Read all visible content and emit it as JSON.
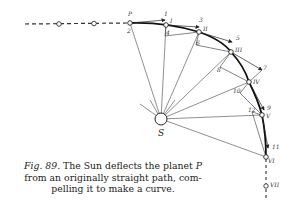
{
  "figure": {
    "number_label": "Fig. 89.",
    "caption_text": "The Sun deflects the planet P from an originally straight path, compelling it to make a curve."
  },
  "caption_lines": {
    "line1_fig": "Fig. 89.",
    "line1_rest": " The Sun deflects the planet ",
    "line1_p": "P",
    "line2": "from an originally straight path, com-",
    "line3": "pelling it to make a curve."
  },
  "diagram": {
    "sun_label": "S",
    "planet_label": "P",
    "orbit_points": [
      {
        "id": "P",
        "label": "P",
        "x": 130,
        "y": 23
      },
      {
        "id": "I",
        "label": "I",
        "x": 166,
        "y": 25
      },
      {
        "id": "II",
        "label": "II",
        "x": 199,
        "y": 32
      },
      {
        "id": "III",
        "label": "III",
        "x": 231,
        "y": 52
      },
      {
        "id": "IV",
        "label": "IV",
        "x": 249,
        "y": 82
      },
      {
        "id": "V",
        "label": "V",
        "x": 262,
        "y": 115
      },
      {
        "id": "VI",
        "label": "VI",
        "x": 266,
        "y": 157
      },
      {
        "id": "VII",
        "label": "VII",
        "x": 266,
        "y": 186
      }
    ],
    "numeric_labels": [
      "1",
      "2",
      "3",
      "4",
      "5",
      "6",
      "7",
      "8",
      "9",
      "10",
      "11",
      "12"
    ],
    "roman_labels": [
      "I",
      "II",
      "III",
      "IV",
      "V",
      "VI",
      "VII"
    ],
    "sun_position": {
      "x": 161,
      "y": 119
    }
  }
}
